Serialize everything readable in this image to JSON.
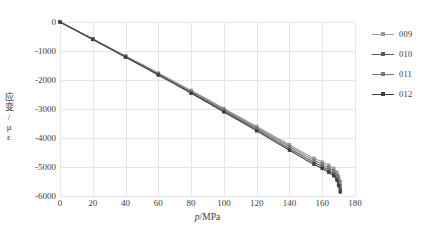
{
  "chart_data": {
    "type": "line",
    "title": "",
    "xlabel": "p/MPa",
    "xlabel_italic_part": "p",
    "xlabel_rest": "/MPa",
    "ylabel": "应变/με",
    "ylabel_chars": [
      "应",
      "变",
      "/",
      "µ",
      "ε"
    ],
    "xlim": [
      0,
      180
    ],
    "ylim": [
      -6000,
      0
    ],
    "xticks": [
      0,
      20,
      40,
      60,
      80,
      100,
      120,
      140,
      160,
      180
    ],
    "yticks": [
      0,
      -1000,
      -2000,
      -3000,
      -4000,
      -5000,
      -6000
    ],
    "ytick_labels": [
      "0",
      "-1000",
      "-2000",
      "-3000",
      "-4000",
      "-5000",
      "-6000"
    ],
    "xtick_labels": [
      "0",
      "20",
      "40",
      "60",
      "80",
      "100",
      "120",
      "140",
      "160",
      "180"
    ],
    "grid": true,
    "grid_color": "#e6e6e6",
    "legend_position": "right",
    "marker": "square",
    "series": [
      {
        "name": "009",
        "color": "#9a9a9a",
        "x": [
          0,
          10,
          20,
          30,
          40,
          50,
          60,
          70,
          80,
          90,
          100,
          110,
          120,
          130,
          140,
          150,
          155,
          160,
          164,
          167,
          169,
          170,
          171
        ],
        "y": [
          0,
          -290,
          -580,
          -880,
          -1170,
          -1460,
          -1760,
          -2060,
          -2360,
          -2660,
          -2980,
          -3290,
          -3600,
          -3920,
          -4230,
          -4560,
          -4700,
          -4830,
          -4940,
          -5050,
          -5180,
          -5320,
          -5500
        ]
      },
      {
        "name": "010",
        "color": "#5a5a5a",
        "x": [
          0,
          10,
          20,
          30,
          40,
          50,
          60,
          70,
          80,
          90,
          100,
          110,
          120,
          130,
          140,
          150,
          155,
          160,
          164,
          167,
          169,
          170,
          171
        ],
        "y": [
          0,
          -295,
          -595,
          -900,
          -1200,
          -1500,
          -1810,
          -2120,
          -2430,
          -2740,
          -3060,
          -3380,
          -3700,
          -4030,
          -4360,
          -4690,
          -4840,
          -4980,
          -5110,
          -5230,
          -5380,
          -5560,
          -5760
        ]
      },
      {
        "name": "011",
        "color": "#7a7a7a",
        "x": [
          0,
          10,
          20,
          30,
          40,
          50,
          60,
          70,
          80,
          90,
          100,
          110,
          120,
          130,
          140,
          150,
          155,
          160,
          164,
          167,
          169,
          170,
          171
        ],
        "y": [
          0,
          -292,
          -588,
          -890,
          -1185,
          -1482,
          -1785,
          -2090,
          -2395,
          -2700,
          -3020,
          -3335,
          -3650,
          -3975,
          -4295,
          -4625,
          -4770,
          -4905,
          -5025,
          -5140,
          -5280,
          -5440,
          -5630
        ]
      },
      {
        "name": "012",
        "color": "#3f3f3f",
        "x": [
          0,
          10,
          20,
          30,
          40,
          50,
          60,
          70,
          80,
          90,
          100,
          110,
          120,
          130,
          140,
          150,
          155,
          160,
          164,
          167,
          169,
          170,
          171
        ],
        "y": [
          0,
          -298,
          -600,
          -908,
          -1212,
          -1515,
          -1828,
          -2142,
          -2458,
          -2775,
          -3100,
          -3425,
          -3752,
          -4085,
          -4420,
          -4755,
          -4905,
          -5050,
          -5180,
          -5300,
          -5455,
          -5640,
          -5860
        ]
      }
    ]
  },
  "legend": {
    "items": [
      {
        "label": "009",
        "color": "#9a9a9a"
      },
      {
        "label": "010",
        "color": "#5a5a5a"
      },
      {
        "label": "011",
        "color": "#7a7a7a"
      },
      {
        "label": "012",
        "color": "#3f3f3f"
      }
    ]
  }
}
